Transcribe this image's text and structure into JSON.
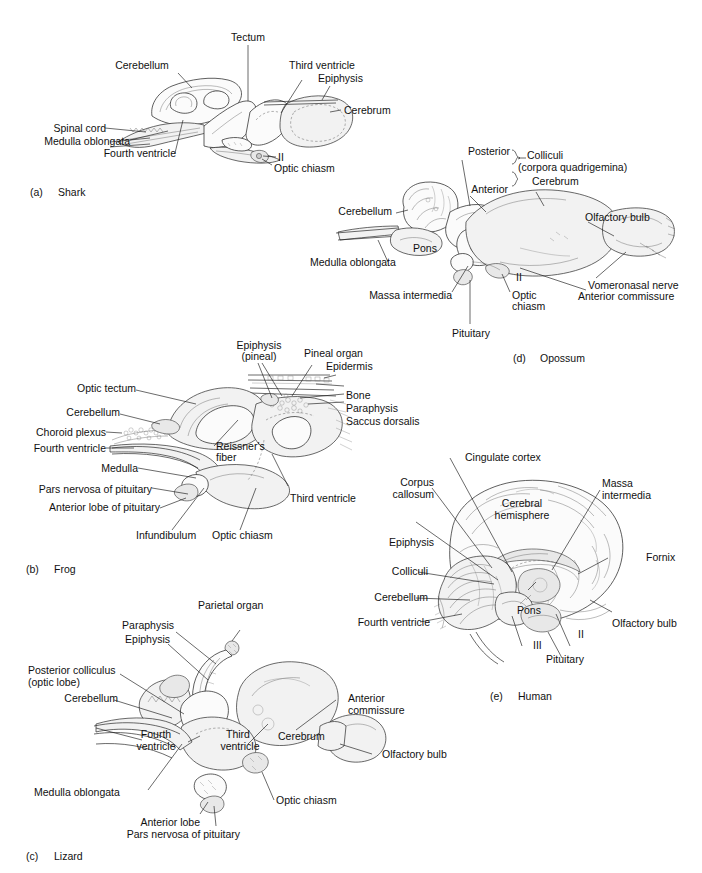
{
  "figure": {
    "panel_label_prefix": "",
    "panels": [
      {
        "id": "a",
        "marker": "(a)",
        "name": "Shark",
        "labels": [
          "Tectum",
          "Cerebellum",
          "Third ventricle",
          "Epiphysis",
          "Cerebrum",
          "Spinal cord",
          "Medulla oblongata",
          "Fourth ventricle",
          "II",
          "Optic chiasm"
        ]
      },
      {
        "id": "b",
        "marker": "(b)",
        "name": "Frog",
        "labels": [
          "Epiphysis",
          "(pineal)",
          "Pineal organ",
          "Epidermis",
          "Optic tectum",
          "Bone",
          "Cerebellum",
          "Paraphysis",
          "Choroid plexus",
          "Saccus dorsalis",
          "Fourth ventricle",
          "Reissner's",
          "fiber",
          "Medulla",
          "Pars nervosa of pituitary",
          "Third ventricle",
          "Anterior lobe of pituitary",
          "Infundibulum",
          "Optic chiasm"
        ]
      },
      {
        "id": "c",
        "marker": "(c)",
        "name": "Lizard",
        "labels": [
          "Parietal organ",
          "Paraphysis",
          "Epiphysis",
          "Posterior colliculus",
          "(optic lobe)",
          "Cerebellum",
          "Anterior",
          "commissure",
          "Fourth",
          "ventricle",
          "Third",
          "ventricle",
          "Cerebrum",
          "Olfactory bulb",
          "Medulla oblongata",
          "Optic chiasm",
          "Anterior lobe",
          "Pars nervosa of pituitary"
        ]
      },
      {
        "id": "d",
        "marker": "(d)",
        "name": "Opossum",
        "labels": [
          "Posterior",
          "Colliculi",
          "(corpora quadrigemina)",
          "Anterior",
          "Cerebrum",
          "Cerebellum",
          "Olfactory bulb",
          "Pons",
          "Medulla oblongata",
          "II",
          "Vomeronasal nerve",
          "Anterior commissure",
          "Massa intermedia",
          "Optic",
          "chiasm",
          "Pituitary"
        ]
      },
      {
        "id": "e",
        "marker": "(e)",
        "name": "Human",
        "labels": [
          "Cingulate cortex",
          "Corpus",
          "callosum",
          "Massa",
          "intermedia",
          "Cerebral",
          "hemisphere",
          "Epiphysis",
          "Fornix",
          "Colliculi",
          "Cerebellum",
          "Pons",
          "Fourth ventricle",
          "III",
          "II",
          "Olfactory bulb",
          "Pituitary"
        ]
      }
    ]
  },
  "panel_a": {
    "marker": "(a)",
    "name": "Shark",
    "tectum": "Tectum",
    "cerebellum": "Cerebellum",
    "third_ventricle": "Third ventricle",
    "epiphysis": "Epiphysis",
    "cerebrum": "Cerebrum",
    "spinal_cord": "Spinal cord",
    "medulla_oblongata": "Medulla oblongata",
    "fourth_ventricle": "Fourth ventricle",
    "nerve_ii": "II",
    "optic_chiasm": "Optic chiasm"
  },
  "panel_b": {
    "marker": "(b)",
    "name": "Frog",
    "epiphysis_l1": "Epiphysis",
    "epiphysis_l2": "(pineal)",
    "pineal_organ": "Pineal organ",
    "epidermis": "Epidermis",
    "optic_tectum": "Optic tectum",
    "bone": "Bone",
    "cerebellum": "Cerebellum",
    "paraphysis": "Paraphysis",
    "choroid_plexus": "Choroid plexus",
    "saccus_dorsalis": "Saccus dorsalis",
    "fourth_ventricle": "Fourth ventricle",
    "reissners_l1": "Reissner's",
    "reissners_l2": "fiber",
    "medulla": "Medulla",
    "pars_nervosa": "Pars nervosa of pituitary",
    "third_ventricle": "Third ventricle",
    "anterior_lobe": "Anterior lobe of pituitary",
    "infundibulum": "Infundibulum",
    "optic_chiasm": "Optic chiasm"
  },
  "panel_c": {
    "marker": "(c)",
    "name": "Lizard",
    "parietal_organ": "Parietal organ",
    "paraphysis": "Paraphysis",
    "epiphysis": "Epiphysis",
    "posterior_colliculus_l1": "Posterior colliculus",
    "posterior_colliculus_l2": "(optic lobe)",
    "cerebellum": "Cerebellum",
    "anterior_commissure_l1": "Anterior",
    "anterior_commissure_l2": "commissure",
    "fourth_ventricle_l1": "Fourth",
    "fourth_ventricle_l2": "ventricle",
    "third_ventricle_l1": "Third",
    "third_ventricle_l2": "ventricle",
    "cerebrum": "Cerebrum",
    "olfactory_bulb": "Olfactory bulb",
    "medulla_oblongata": "Medulla oblongata",
    "optic_chiasm": "Optic chiasm",
    "anterior_lobe": "Anterior lobe",
    "pars_nervosa": "Pars nervosa of pituitary"
  },
  "panel_d": {
    "marker": "(d)",
    "name": "Opossum",
    "posterior": "Posterior",
    "colliculi": "Colliculi",
    "corpora_quadrigemina": "(corpora quadrigemina)",
    "anterior": "Anterior",
    "cerebrum": "Cerebrum",
    "cerebellum": "Cerebellum",
    "olfactory_bulb": "Olfactory bulb",
    "pons": "Pons",
    "medulla_oblongata": "Medulla oblongata",
    "nerve_ii": "II",
    "vomeronasal_nerve": "Vomeronasal nerve",
    "anterior_commissure": "Anterior commissure",
    "massa_intermedia": "Massa intermedia",
    "optic_l1": "Optic",
    "optic_l2": "chiasm",
    "pituitary": "Pituitary"
  },
  "panel_e": {
    "marker": "(e)",
    "name": "Human",
    "cingulate_cortex": "Cingulate cortex",
    "corpus_l1": "Corpus",
    "corpus_l2": "callosum",
    "massa_l1": "Massa",
    "massa_l2": "intermedia",
    "cerebral_l1": "Cerebral",
    "cerebral_l2": "hemisphere",
    "epiphysis": "Epiphysis",
    "fornix": "Fornix",
    "colliculi": "Colliculi",
    "cerebellum": "Cerebellum",
    "pons": "Pons",
    "fourth_ventricle": "Fourth ventricle",
    "nerve_iii": "III",
    "nerve_ii": "II",
    "olfactory_bulb": "Olfactory bulb",
    "pituitary": "Pituitary"
  }
}
